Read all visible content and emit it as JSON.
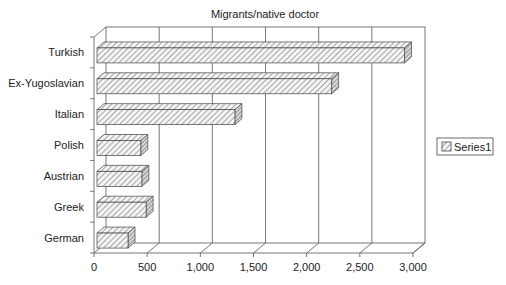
{
  "chart_data": {
    "type": "bar",
    "orientation": "horizontal",
    "style": "3d-clustered-bar",
    "title": "Migrants/native doctor",
    "xlabel": "",
    "ylabel": "",
    "categories": [
      "Turkish",
      "Ex-Yugoslavian",
      "Italian",
      "Polish",
      "Austrian",
      "Greek",
      "German"
    ],
    "series": [
      {
        "name": "Series1",
        "values": [
          2920,
          2235,
          1325,
          440,
          450,
          490,
          320
        ]
      }
    ],
    "xlim": [
      0,
      3000
    ],
    "x_ticks": [
      0,
      500,
      1000,
      1500,
      2000,
      2500,
      3000
    ],
    "x_tick_labels": [
      "0",
      "500",
      "1,000",
      "1,500",
      "2,000",
      "2,500",
      "3,000"
    ],
    "grid": true,
    "legend": {
      "position": "right",
      "entries": [
        "Series1"
      ]
    },
    "fill_pattern": "diagonal-hatch",
    "colors": {
      "bar_stroke": "#444444",
      "hatch": "#666666",
      "grid": "#555555",
      "background": "#ffffff"
    }
  }
}
